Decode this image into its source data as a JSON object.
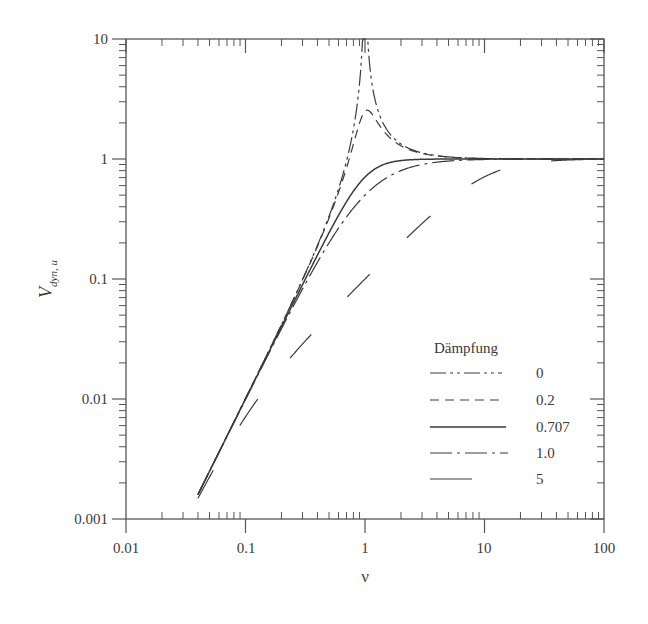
{
  "chart_data": {
    "type": "line",
    "title": "",
    "xlabel": "ν",
    "ylabel": "V",
    "ylabel_subscript": "dyn, u",
    "xscale": "log",
    "yscale": "log",
    "xlim": [
      0.01,
      100
    ],
    "ylim": [
      0.001,
      10
    ],
    "grid": false,
    "x_ticks": [
      "0.01",
      "0.1",
      "1",
      "10",
      "100"
    ],
    "y_ticks": [
      "0.001",
      "0.01",
      "0.1",
      "1",
      "10"
    ],
    "legend": {
      "title": "Dämpfung",
      "position": "lower right",
      "entries": [
        "0",
        "0.2",
        "0.707",
        "1.0",
        "5"
      ]
    },
    "formula": "V = ν² / sqrt((1-ν²)² + (2·D·ν)²)",
    "x": [
      0.04,
      0.1,
      0.2,
      0.5,
      0.8,
      1.0,
      1.25,
      2,
      5,
      10,
      20,
      50,
      100
    ],
    "series": [
      {
        "name": "0",
        "damping": 0,
        "style": "dash-dot",
        "values": [
          0.0016,
          0.0101,
          0.0417,
          0.333,
          1.78,
          10.0,
          2.78,
          1.33,
          1.04,
          1.01,
          1.0,
          1.0,
          1.0
        ]
      },
      {
        "name": "0.2",
        "damping": 0.2,
        "style": "dashed",
        "values": [
          0.0016,
          0.0101,
          0.0414,
          0.316,
          1.12,
          2.5,
          1.69,
          1.28,
          1.04,
          1.01,
          1.0,
          1.0,
          1.0
        ]
      },
      {
        "name": "0.707",
        "damping": 0.707,
        "style": "solid",
        "values": [
          0.0016,
          0.01,
          0.04,
          0.243,
          0.54,
          0.707,
          0.84,
          0.97,
          1.0,
          1.0,
          1.0,
          1.0,
          1.0
        ]
      },
      {
        "name": "1.0",
        "damping": 1.0,
        "style": "dash-dot-dot",
        "values": [
          0.0016,
          0.0098,
          0.0385,
          0.2,
          0.39,
          0.5,
          0.61,
          0.8,
          0.96,
          0.99,
          1.0,
          1.0,
          1.0
        ]
      },
      {
        "name": "5",
        "damping": 5,
        "style": "long-dash",
        "values": [
          0.0015,
          0.005,
          0.0097,
          0.0249,
          0.0397,
          0.0499,
          0.0624,
          0.0995,
          0.447,
          0.707,
          0.894,
          0.981,
          0.995
        ]
      }
    ]
  },
  "axes": {
    "x_label": "ν",
    "y_label_main": "V",
    "y_label_sub": "dyn, u",
    "x_ticks": [
      "0.01",
      "0.1",
      "1",
      "10",
      "100"
    ],
    "y_ticks": [
      "0.001",
      "0.01",
      "0.1",
      "1",
      "10"
    ]
  },
  "legend": {
    "title": "Dämpfung",
    "entries": [
      {
        "label": "0",
        "dash": "16 4 3 4 3 4"
      },
      {
        "label": "0.2",
        "dash": "9 6"
      },
      {
        "label": "0.707",
        "dash": ""
      },
      {
        "label": "1.0",
        "dash": "22 5 3 5"
      },
      {
        "label": "5",
        "dash": "32 52"
      }
    ]
  },
  "colors": {
    "axis": "#555555",
    "line": "#3a3a3a",
    "text": "#3a3a3a",
    "background": "#ffffff"
  }
}
